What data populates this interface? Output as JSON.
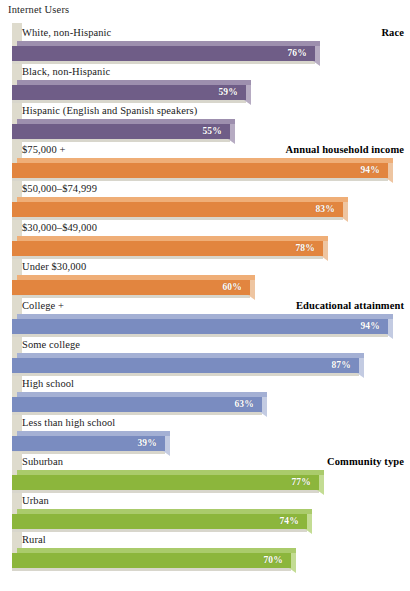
{
  "chart_data": {
    "type": "bar",
    "title": "Internet Users",
    "xlabel": "",
    "ylabel": "",
    "orientation": "horizontal",
    "xlim": [
      0,
      100
    ],
    "grid": false,
    "legend": "none",
    "value_suffix": "%",
    "groups": [
      {
        "title": "Race",
        "color": "#6f5d87",
        "color_top": "#9d8fae",
        "color_cap": "#b6abc2",
        "categories": [
          "White, non-Hispanic",
          "Black, non-Hispanic",
          "Hispanic (English and Spanish speakers)"
        ],
        "values": [
          76,
          59,
          55
        ],
        "labels": [
          "76%",
          "59%",
          "55%"
        ]
      },
      {
        "title": "Annual household income",
        "color": "#e2853f",
        "color_top": "#efae77",
        "color_cap": "#eec5a1",
        "categories": [
          "$75,000 +",
          "$50,000–$74,999",
          "$30,000–$49,000",
          "Under $30,000"
        ],
        "values": [
          94,
          83,
          78,
          60
        ],
        "labels": [
          "94%",
          "83%",
          "78%",
          "60%"
        ]
      },
      {
        "title": "Educational attainment",
        "color": "#7a8cc0",
        "color_top": "#a4b0d4",
        "color_cap": "#c3cbe2",
        "categories": [
          "College +",
          "Some college",
          "High school",
          "Less than high school"
        ],
        "values": [
          94,
          87,
          63,
          39
        ],
        "labels": [
          "94%",
          "87%",
          "63%",
          "39%"
        ]
      },
      {
        "title": "Community type",
        "color": "#8cb63c",
        "color_top": "#aacb6b",
        "color_cap": "#c3dc93",
        "categories": [
          "Suburban",
          "Urban",
          "Rural"
        ],
        "values": [
          77,
          74,
          70
        ],
        "labels": [
          "77%",
          "74%",
          "70%"
        ]
      }
    ]
  }
}
